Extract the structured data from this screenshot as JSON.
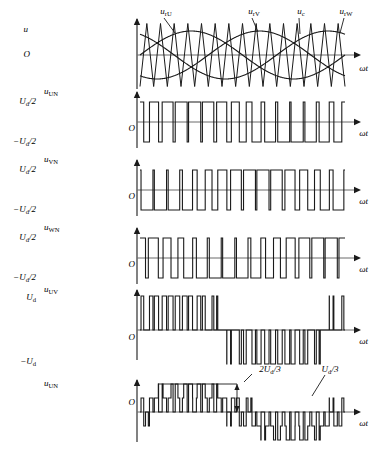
{
  "figure": {
    "background": "#ffffff",
    "stroke": "#1a1a1a",
    "axis_color": "#6b6b6b",
    "width": 375,
    "height": 451
  },
  "axis_label_omega_t": "ωt",
  "origin_label": "O",
  "panels": [
    {
      "id": "carrier-reference",
      "y_label": "u",
      "y_label_sub": "",
      "x_label": "ωt",
      "origin": "O",
      "level_labels": [],
      "annotations": [
        {
          "id": "u-rU",
          "text": "u",
          "sub": "rU"
        },
        {
          "id": "u-rV",
          "text": "u",
          "sub": "rV"
        },
        {
          "id": "u-c",
          "text": "u",
          "sub": "c"
        },
        {
          "id": "u-rW",
          "text": "u",
          "sub": "rW"
        }
      ]
    },
    {
      "id": "u-UN",
      "y_label": "u",
      "y_label_sub": "UN",
      "x_label": "ωt",
      "origin": "O",
      "level_labels": [
        {
          "text": "U",
          "sub": "d",
          "suffix": "/2",
          "value": 1
        },
        {
          "text": "−U",
          "sub": "d",
          "suffix": "/2",
          "value": -1
        }
      ],
      "annotations": []
    },
    {
      "id": "u-VN",
      "y_label": "u",
      "y_label_sub": "VN",
      "x_label": "ωt",
      "origin": "O",
      "level_labels": [
        {
          "text": "U",
          "sub": "d",
          "suffix": "/2",
          "value": 1
        },
        {
          "text": "−U",
          "sub": "d",
          "suffix": "/2",
          "value": -1
        }
      ],
      "annotations": []
    },
    {
      "id": "u-WN",
      "y_label": "u",
      "y_label_sub": "WN",
      "x_label": "ωt",
      "origin": "O",
      "level_labels": [
        {
          "text": "U",
          "sub": "d",
          "suffix": "/2",
          "value": 1
        },
        {
          "text": "−U",
          "sub": "d",
          "suffix": "/2",
          "value": -1
        }
      ],
      "annotations": []
    },
    {
      "id": "u-UV",
      "y_label": "u",
      "y_label_sub": "UV",
      "x_label": "ωt",
      "origin": "O",
      "level_labels": [
        {
          "text": "U",
          "sub": "d",
          "suffix": "",
          "value": 1
        },
        {
          "text": "−U",
          "sub": "d",
          "suffix": "",
          "value": -1
        }
      ],
      "annotations": []
    },
    {
      "id": "u-UN-load",
      "y_label": "u",
      "y_label_sub": "UN",
      "x_label": "ωt",
      "origin": "O",
      "level_labels": [],
      "annotations": [
        {
          "id": "two-thirds-ud",
          "text": "2U",
          "sub": "d",
          "suffix": "/3"
        },
        {
          "id": "one-third-ud",
          "text": "U",
          "sub": "d",
          "suffix": "/3"
        }
      ]
    }
  ],
  "chart_data": {
    "type": "line",
    "xlabel": "ωt",
    "ylabel": "u",
    "grid": false,
    "legend": "inline-annotations",
    "carrier_ratio": 15,
    "modulation_index": 0.8,
    "fundamental_cycles": 1,
    "x_range_deg": [
      0,
      360
    ],
    "series": [
      {
        "name": "u_rU",
        "type": "sine",
        "amplitude": 0.8,
        "phase_deg": 0,
        "panel": "carrier-reference"
      },
      {
        "name": "u_rV",
        "type": "sine",
        "amplitude": 0.8,
        "phase_deg": -120,
        "panel": "carrier-reference"
      },
      {
        "name": "u_rW",
        "type": "sine",
        "amplitude": 0.8,
        "phase_deg": 120,
        "panel": "carrier-reference"
      },
      {
        "name": "u_c",
        "type": "triangle",
        "amplitude": 1.0,
        "periods": 15,
        "panel": "carrier-reference"
      },
      {
        "name": "u_UN",
        "type": "pwm-bipolar",
        "levels": [
          1,
          -1
        ],
        "reference_phase_deg": 0,
        "panel": "u-UN"
      },
      {
        "name": "u_VN",
        "type": "pwm-bipolar",
        "levels": [
          1,
          -1
        ],
        "reference_phase_deg": -120,
        "panel": "u-VN"
      },
      {
        "name": "u_WN",
        "type": "pwm-bipolar",
        "levels": [
          1,
          -1
        ],
        "reference_phase_deg": 120,
        "panel": "u-WN"
      },
      {
        "name": "u_UV",
        "type": "pwm-line-to-line",
        "levels": [
          1,
          0,
          -1
        ],
        "derived": "u_UN - u_VN",
        "panel": "u-UV"
      },
      {
        "name": "u_UN_load",
        "type": "pwm-stepped",
        "levels": [
          0.667,
          0.333,
          0,
          -0.333,
          -0.667
        ],
        "derived": "(2*u_UN - u_VN - u_WN)/3",
        "panel": "u-UN-load"
      }
    ],
    "annotation_values": [
      {
        "label": "2U_d/3",
        "value": 0.667
      },
      {
        "label": "U_d/3",
        "value": 0.333
      }
    ]
  }
}
